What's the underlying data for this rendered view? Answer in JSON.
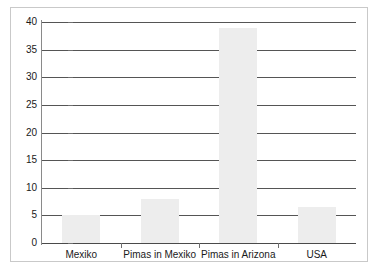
{
  "chart_data": {
    "type": "bar",
    "title": "",
    "subtitle": "",
    "xlabel": "",
    "ylabel": "",
    "categories": [
      "Mexiko",
      "Pimas in Mexiko",
      "Pimas in Arizona",
      "USA"
    ],
    "values": [
      5,
      8,
      39,
      6.5
    ],
    "ylim": [
      0,
      40
    ],
    "ytick_labels": [
      "0",
      "5",
      "10",
      "15",
      "20",
      "25",
      "30",
      "35",
      "40"
    ],
    "ytick_values": [
      0,
      5,
      10,
      15,
      20,
      25,
      30,
      35,
      40
    ],
    "grid": true,
    "legend": false,
    "legend_position": "none",
    "orientation": "vertical",
    "bar_color": "#ededed",
    "axis_color": "#555555",
    "frame_color": "#c9c9c9",
    "background": "#ffffff"
  }
}
